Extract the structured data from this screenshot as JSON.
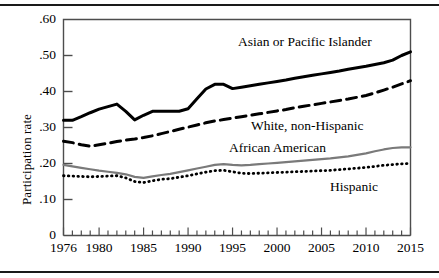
{
  "figure": {
    "ylabel": "Participation rate",
    "ytick_labels": [
      ".60",
      ".50",
      ".40",
      ".30",
      ".20",
      ".10",
      "0"
    ],
    "xtick_labels": [
      "1976",
      "1980",
      "1985",
      "1990",
      "1995",
      "2000",
      "2005",
      "2010",
      "2015"
    ],
    "series_labels": {
      "asian": "Asian or Pacific Islander",
      "white": "White, non-Hispanic",
      "african": "African American",
      "hispanic": "Hispanic"
    },
    "colors": {
      "asian": "#000000",
      "white": "#000000",
      "african": "#7a7a7a",
      "hispanic": "#000000",
      "axis": "#4d4d4d",
      "rule": "#1a1a1a"
    }
  },
  "chart_data": {
    "type": "line",
    "title": "",
    "xlabel": "",
    "ylabel": "Participation rate",
    "xlim": [
      1976,
      2015
    ],
    "ylim": [
      0,
      0.6
    ],
    "yticks": [
      0,
      0.1,
      0.2,
      0.3,
      0.4,
      0.5,
      0.6
    ],
    "ytick_labels": [
      "0",
      ".10",
      ".20",
      ".30",
      ".40",
      ".50",
      ".60"
    ],
    "xticks": [
      1976,
      1980,
      1985,
      1990,
      1995,
      2000,
      2005,
      2010,
      2015
    ],
    "minor_xticks_every": 1,
    "grid": false,
    "legend": "inline-annotations",
    "x": [
      1976,
      1977,
      1978,
      1979,
      1980,
      1981,
      1982,
      1983,
      1984,
      1985,
      1986,
      1987,
      1988,
      1989,
      1990,
      1991,
      1992,
      1993,
      1994,
      1995,
      1996,
      1997,
      1998,
      1999,
      2000,
      2001,
      2002,
      2003,
      2004,
      2005,
      2006,
      2007,
      2008,
      2009,
      2010,
      2011,
      2012,
      2013,
      2014,
      2015
    ],
    "series": [
      {
        "name": "Asian or Pacific Islander",
        "style": "solid-thick",
        "color": "#000000",
        "values": [
          0.32,
          0.32,
          0.33,
          0.341,
          0.351,
          0.358,
          0.365,
          0.345,
          0.321,
          0.334,
          0.345,
          0.345,
          0.345,
          0.345,
          0.352,
          0.38,
          0.407,
          0.42,
          0.42,
          0.408,
          0.412,
          0.416,
          0.42,
          0.424,
          0.428,
          0.432,
          0.437,
          0.441,
          0.445,
          0.449,
          0.453,
          0.457,
          0.462,
          0.466,
          0.47,
          0.475,
          0.48,
          0.487,
          0.5,
          0.51
        ]
      },
      {
        "name": "White, non-Hispanic",
        "style": "dashed-thick",
        "color": "#000000",
        "values": [
          0.262,
          0.258,
          0.252,
          0.248,
          0.252,
          0.256,
          0.261,
          0.265,
          0.268,
          0.272,
          0.277,
          0.283,
          0.289,
          0.295,
          0.301,
          0.307,
          0.313,
          0.318,
          0.322,
          0.326,
          0.33,
          0.334,
          0.338,
          0.342,
          0.346,
          0.35,
          0.355,
          0.359,
          0.363,
          0.367,
          0.371,
          0.375,
          0.379,
          0.384,
          0.389,
          0.396,
          0.404,
          0.412,
          0.421,
          0.43
        ]
      },
      {
        "name": "African American",
        "style": "solid-gray",
        "color": "#7a7a7a",
        "values": [
          0.196,
          0.192,
          0.188,
          0.184,
          0.18,
          0.177,
          0.174,
          0.17,
          0.163,
          0.16,
          0.164,
          0.168,
          0.171,
          0.176,
          0.181,
          0.186,
          0.191,
          0.196,
          0.198,
          0.196,
          0.195,
          0.196,
          0.198,
          0.2,
          0.202,
          0.204,
          0.206,
          0.208,
          0.21,
          0.212,
          0.214,
          0.217,
          0.22,
          0.224,
          0.228,
          0.234,
          0.239,
          0.243,
          0.245,
          0.245
        ]
      },
      {
        "name": "Hispanic",
        "style": "dotted",
        "color": "#000000",
        "values": [
          0.166,
          0.165,
          0.164,
          0.163,
          0.164,
          0.165,
          0.166,
          0.16,
          0.15,
          0.147,
          0.152,
          0.156,
          0.158,
          0.162,
          0.166,
          0.171,
          0.176,
          0.18,
          0.181,
          0.177,
          0.173,
          0.172,
          0.173,
          0.174,
          0.175,
          0.176,
          0.177,
          0.178,
          0.179,
          0.18,
          0.181,
          0.183,
          0.185,
          0.187,
          0.189,
          0.192,
          0.195,
          0.197,
          0.199,
          0.2
        ]
      }
    ]
  }
}
